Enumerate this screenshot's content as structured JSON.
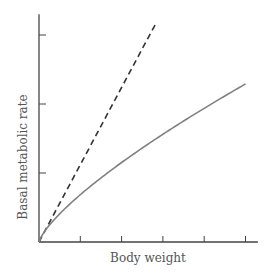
{
  "chart_data": {
    "type": "line",
    "title": "",
    "xlabel": "Body weight",
    "ylabel": "Basal metabolic rate",
    "xlim": [
      0,
      5.3
    ],
    "ylim": [
      0,
      3.3
    ],
    "x_ticks": [
      1,
      2,
      3,
      4,
      5
    ],
    "y_ticks": [
      1,
      2,
      3
    ],
    "tick_labels_shown": false,
    "grid": false,
    "legend": null,
    "series": [
      {
        "name": "Proportional (linear) scaling",
        "style": "dashed",
        "color": "#333333",
        "x": [
          0,
          0.5,
          1,
          1.5,
          2,
          2.5,
          2.85
        ],
        "values": [
          0,
          0.56,
          1.12,
          1.68,
          2.24,
          2.8,
          3.19
        ]
      },
      {
        "name": "Observed (power law, exponent ~0.75)",
        "style": "solid",
        "color": "#808080",
        "x": [
          0,
          0.25,
          0.5,
          1,
          1.5,
          2,
          2.5,
          3,
          3.5,
          4,
          4.5,
          5
        ],
        "values": [
          0,
          0.24,
          0.41,
          0.69,
          0.93,
          1.15,
          1.36,
          1.56,
          1.75,
          1.94,
          2.12,
          2.29
        ]
      }
    ]
  },
  "labels": {
    "x_axis": "Body weight",
    "y_axis": "Basal metabolic rate"
  },
  "colors": {
    "axis": "#444444",
    "dashed": "#333333",
    "solid": "#808080",
    "text": "#555555"
  }
}
